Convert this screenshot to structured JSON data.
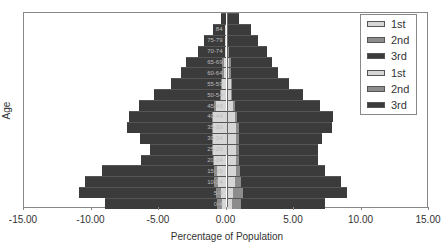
{
  "chart_data": {
    "type": "bar",
    "subtype": "population-pyramid (horizontal stacked bar)",
    "title": "",
    "xlabel": "Percentage of Population",
    "ylabel": "Age",
    "xlim": [
      -15,
      15
    ],
    "x_ticks": [
      "-15.00",
      "-10.00",
      "-5.00",
      "0.00",
      "5.00",
      "10.00",
      "15.00"
    ],
    "grid": false,
    "legend_position": "upper right",
    "legend": [
      "1st",
      "2nd",
      "3rd",
      "1st",
      "2nd",
      "3rd"
    ],
    "colors": {
      "1st": "#d6d6d6",
      "2nd": "#8c8c8c",
      "3rd": "#3b3b3b"
    },
    "categories": [
      "0-4",
      "5-9",
      "10-14",
      "15-19",
      "20-24",
      "25-29",
      "30-34",
      "35-39",
      "40-44",
      "45-49",
      "50-54",
      "55-59",
      "60-64",
      "65-69",
      "70-74",
      "75-79",
      "84",
      ""
    ],
    "category_labels_visible": [
      "0-4",
      "5-9",
      "10-14",
      "15-19",
      "20-24",
      "25-29",
      "30-34",
      "35-39",
      "40-44",
      "45-49",
      "50-54",
      "55-59",
      "60-64",
      "65-69",
      "70-74",
      "75-79",
      "84",
      ""
    ],
    "series": [
      {
        "name": "1st",
        "side": "left",
        "values": [
          -0.3,
          -0.4,
          -0.6,
          -0.7,
          -0.9,
          -1.0,
          -1.0,
          -1.0,
          -1.0,
          -0.8,
          -0.4,
          -0.3,
          -0.2,
          -0.2,
          -0.1,
          -0.1,
          -0.1,
          0.0
        ]
      },
      {
        "name": "2nd",
        "side": "left",
        "values": [
          -0.4,
          -0.4,
          -0.3,
          -0.2,
          -0.1,
          -0.1,
          -0.1,
          -0.1,
          -0.1,
          -0.1,
          -0.1,
          -0.1,
          -0.1,
          -0.1,
          0.0,
          0.0,
          0.0,
          0.0
        ]
      },
      {
        "name": "3rd",
        "side": "left",
        "values": [
          -8.3,
          -10.1,
          -9.6,
          -8.3,
          -5.3,
          -4.6,
          -5.3,
          -6.3,
          -6.1,
          -5.6,
          -4.9,
          -3.7,
          -3.1,
          -2.7,
          -2.0,
          -1.6,
          -0.9,
          -0.4
        ]
      },
      {
        "name": "1st",
        "side": "right",
        "values": [
          0.4,
          0.5,
          0.6,
          0.7,
          0.7,
          0.7,
          0.7,
          0.7,
          0.6,
          0.5,
          0.3,
          0.3,
          0.2,
          0.2,
          0.1,
          0.1,
          0.1,
          0.0
        ]
      },
      {
        "name": "2nd",
        "side": "right",
        "values": [
          0.7,
          0.7,
          0.5,
          0.3,
          0.2,
          0.2,
          0.2,
          0.2,
          0.2,
          0.1,
          0.1,
          0.1,
          0.1,
          0.1,
          0.1,
          0.0,
          0.0,
          0.0
        ]
      },
      {
        "name": "3rd",
        "side": "right",
        "values": [
          6.2,
          7.7,
          7.4,
          6.3,
          5.9,
          5.9,
          6.2,
          6.9,
          7.1,
          6.3,
          5.3,
          4.2,
          3.5,
          3.1,
          2.8,
          2.2,
          1.7,
          0.9
        ]
      }
    ],
    "totals_left": [
      -9.0,
      -10.9,
      -10.5,
      -9.2,
      -6.3,
      -5.7,
      -6.4,
      -7.4,
      -7.2,
      -6.5,
      -5.4,
      -4.1,
      -3.4,
      -3.0,
      -2.1,
      -1.7,
      -1.0,
      -0.4
    ],
    "totals_right": [
      7.3,
      8.9,
      8.5,
      7.3,
      6.8,
      6.8,
      7.1,
      7.8,
      7.9,
      6.9,
      5.7,
      4.6,
      3.8,
      3.4,
      3.0,
      2.3,
      1.8,
      0.9
    ]
  },
  "axis": {
    "xlabel": "Percentage of Population",
    "ylabel": "Age",
    "ticks": [
      "-15.00",
      "-10.00",
      "-5.00",
      "0.00",
      "5.00",
      "10.00",
      "15.00"
    ]
  },
  "legend": {
    "items": [
      {
        "label": "1st",
        "color": "#d6d6d6"
      },
      {
        "label": "2nd",
        "color": "#8c8c8c"
      },
      {
        "label": "3rd",
        "color": "#3b3b3b"
      },
      {
        "label": "1st",
        "color": "#d6d6d6"
      },
      {
        "label": "2nd",
        "color": "#8c8c8c"
      },
      {
        "label": "3rd",
        "color": "#3b3b3b"
      }
    ]
  }
}
